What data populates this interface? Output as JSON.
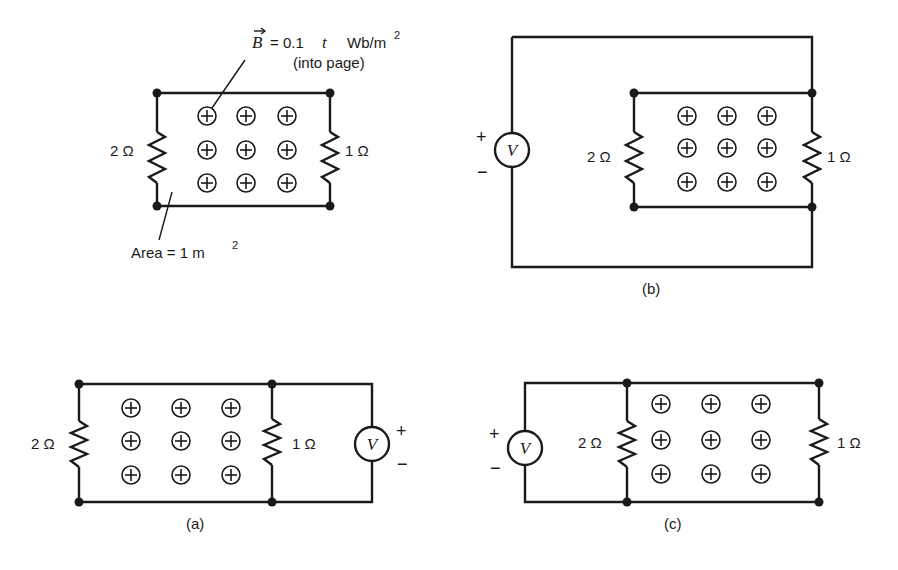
{
  "figure": {
    "top_left": {
      "field_label": {
        "symbol": "B",
        "equation": "= 0.1",
        "t": "t",
        "units": "Wb/m",
        "units_exp": "2",
        "note": "(into page)"
      },
      "area_label": {
        "text": "Area = 1 m",
        "exp": "2"
      },
      "left_resistor": "2 Ω",
      "right_resistor": "1 Ω"
    },
    "b": {
      "caption": "(b)",
      "left_resistor": "2 Ω",
      "right_resistor": "1 Ω",
      "meter": "V",
      "plus": "+",
      "minus": "−"
    },
    "a": {
      "caption": "(a)",
      "left_resistor": "2 Ω",
      "right_resistor": "1 Ω",
      "meter": "V",
      "plus": "+",
      "minus": "−"
    },
    "c": {
      "caption": "(c)",
      "left_resistor": "2 Ω",
      "right_resistor": "1 Ω",
      "meter": "V",
      "plus": "+",
      "minus": "−"
    },
    "field_symbol": "into-page-cross-circle"
  }
}
